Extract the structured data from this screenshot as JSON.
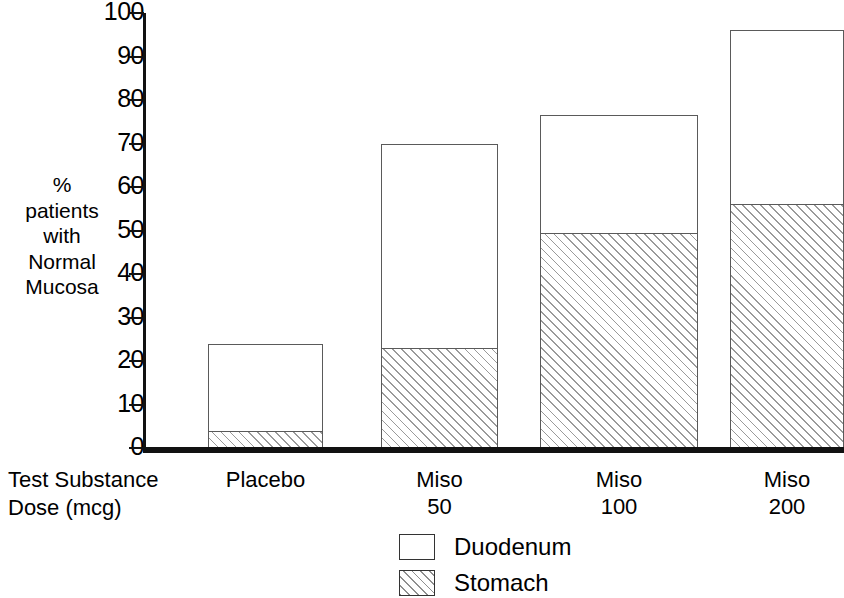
{
  "chart_data": {
    "type": "bar",
    "title": "",
    "subtitle": "",
    "stacked": true,
    "categories": [
      "Placebo",
      "Miso 50",
      "Miso 100",
      "Miso 200"
    ],
    "category_lines": [
      [
        "Placebo"
      ],
      [
        "Miso",
        "50"
      ],
      [
        "Miso",
        "100"
      ],
      [
        "Miso",
        "200"
      ]
    ],
    "series": [
      {
        "name": "Stomach",
        "values": [
          4,
          23,
          49.5,
          56
        ]
      },
      {
        "name": "Duodenum",
        "values": [
          20,
          47,
          27,
          40
        ]
      }
    ],
    "totals": [
      24,
      70,
      76.5,
      96
    ],
    "ylabel_lines": [
      "%",
      "patients",
      "with",
      "Normal",
      "Mucosa"
    ],
    "ylabel": "% patients with Normal Mucosa",
    "xlabel_lines": [
      "Test Substance",
      "Dose (mcg)"
    ],
    "xlabel": "Test Substance Dose (mcg)",
    "ylim": [
      0,
      100
    ],
    "ytick_labels": [
      "0",
      "10",
      "20",
      "30",
      "40",
      "50",
      "60",
      "70",
      "80",
      "90",
      "100"
    ],
    "ytick_values": [
      0,
      10,
      20,
      30,
      40,
      50,
      60,
      70,
      80,
      90,
      100
    ],
    "grid": false,
    "legend_position": "bottom",
    "legend": [
      {
        "label": "Duodenum",
        "swatch": "open-white-box"
      },
      {
        "label": "Stomach",
        "swatch": "hatched-box"
      }
    ],
    "colors": {
      "axis": "#111111",
      "bar_outline": "#5a5a5a",
      "duodenum_fill": "#ffffff",
      "stomach_hatch": "#9a9a9a",
      "background": "#ffffff",
      "text": "#000000"
    }
  }
}
